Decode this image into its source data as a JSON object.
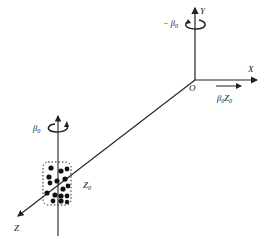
{
  "diagram": {
    "labels": {
      "y_axis": "Y",
      "x_axis": "X",
      "z_axis": "Z",
      "origin": "O",
      "rotation_top": "− β",
      "rotation_top_sub": "0",
      "rotation_bottom": "β",
      "rotation_bottom_sub": "0",
      "translation": "β",
      "translation_sub": "0",
      "translation_z": "Z",
      "translation_z_sub": "0",
      "cluster": "Z",
      "cluster_sub": "0"
    },
    "colors": {
      "line": "#222222",
      "background": "#ffffff"
    }
  }
}
